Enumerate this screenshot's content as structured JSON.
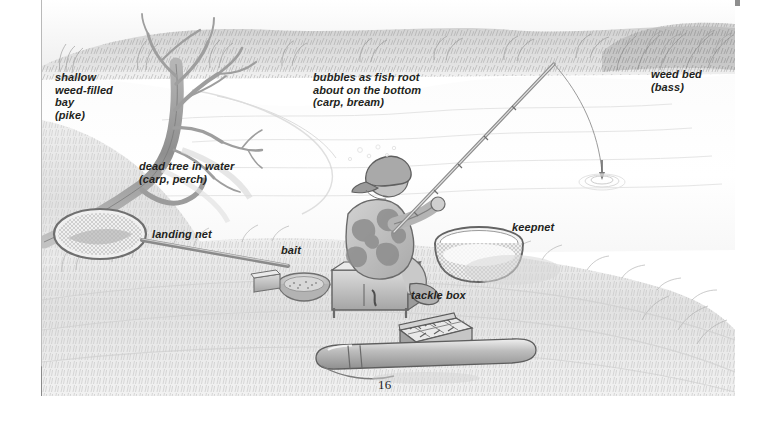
{
  "page": {
    "folio": "16",
    "background_color": "#ffffff",
    "accent_gray": "#8e8e8e",
    "ink_color": "#231f20"
  },
  "illustration": {
    "title": "Angler fishing a still-water lake with habitat annotations",
    "medium": "pencil / graphite tone drawing",
    "palette": {
      "water": "#fbfbfb",
      "sky": "#f4f4f4",
      "bank_grass": "#dedede",
      "far_bank_weed": "#b8b8b8",
      "tree": "#9a9a9a",
      "figure_jacket": "#c6c6c6",
      "outline": "#6d6d6d"
    }
  },
  "labels": {
    "shallow_bay": "shallow\nweed-filled\nbay\n(pike)",
    "dead_tree": "dead tree in water\n(carp, perch)",
    "bubbles": "bubbles as fish root\nabout on the bottom\n(carp, bream)",
    "weed_bed": "weed bed\n(bass)",
    "landing_net": "landing net",
    "bait": "bait",
    "keepnet": "keepnet",
    "tackle_box": "tackle box"
  },
  "scene_objects": [
    {
      "name": "far-bank-vegetation",
      "description": "reed and grass fringe along the far shore"
    },
    {
      "name": "dead-tree",
      "description": "fallen bare tree lying into the water on the left bank"
    },
    {
      "name": "angler",
      "description": "seated angler in camouflage jacket and flat cap holding a rod"
    },
    {
      "name": "seat-box",
      "description": "angler sits on a tackle seat box"
    },
    {
      "name": "fishing-rod",
      "description": "rod angled up-right with line running to float"
    },
    {
      "name": "float",
      "description": "float sitting in the water with ripple rings"
    },
    {
      "name": "landing-net",
      "description": "round landing net on a long handle laid on the bank"
    },
    {
      "name": "bait-bowl",
      "description": "bowl of groundbait with a square bait box beside it"
    },
    {
      "name": "keepnet",
      "description": "cylindrical keepnet ring set in the margin"
    },
    {
      "name": "tackle-box",
      "description": "open tackle box showing floats and hooks"
    },
    {
      "name": "rod-holdall",
      "description": "rod tube / holdall lying in the foreground grass"
    }
  ]
}
